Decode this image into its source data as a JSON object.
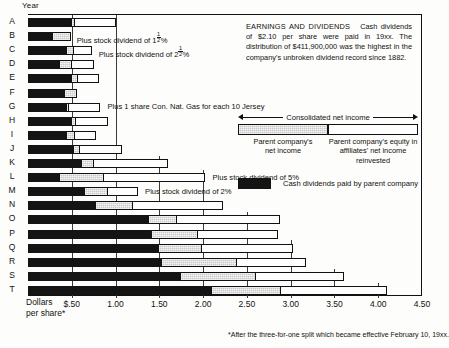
{
  "axis": {
    "y_title": "Year",
    "x_title_line1": "Dollars",
    "x_title_line2": "per share*",
    "ticks": [
      "$.50",
      "1.00",
      "1.50",
      "2.00",
      "2.50",
      "3.00",
      "3.50",
      "4.00",
      "4.50"
    ]
  },
  "headline": {
    "title": "EARNINGS AND DIVIDENDS",
    "body": "Cash dividends of $2.10 per share were paid in 19xx. The distribution of $411,900,000 was the highest in the company's unbroken dividend record since 1882."
  },
  "legend": {
    "consolidated_label": "Consolidated net income",
    "parent_caption_line1": "Parent company's",
    "parent_caption_line2": "net income",
    "affiliates_caption_line1": "Parent company's equity in",
    "affiliates_caption_line2": "affiliates' net income reinvested",
    "cash_label": "Cash dividends paid by parent company"
  },
  "footnote": "*After the three-for-one split which became effective February 10, 19xx.",
  "colors": {
    "cash": "#141414",
    "parent": "#c9c9c9",
    "affiliates": "#fefefe",
    "rule": "#111111"
  },
  "chart_data": {
    "type": "bar",
    "orientation": "horizontal",
    "stacked": true,
    "title": "EARNINGS AND DIVIDENDS",
    "xlabel": "Dollars per share*",
    "ylabel": "Year",
    "xlim": [
      0,
      4.5
    ],
    "xtick_values": [
      0.5,
      1.0,
      1.5,
      2.0,
      2.5,
      3.0,
      3.5,
      4.0,
      4.5
    ],
    "xtick_labels": [
      "$.50",
      "1.00",
      "1.50",
      "2.00",
      "2.50",
      "3.00",
      "3.50",
      "4.00",
      "4.50"
    ],
    "grid": "vertical-partial",
    "legend_position": "upper-right",
    "categories": [
      "A",
      "B",
      "C",
      "D",
      "E",
      "F",
      "G",
      "H",
      "I",
      "J",
      "K",
      "L",
      "M",
      "N",
      "O",
      "P",
      "Q",
      "R",
      "S",
      "T"
    ],
    "series": [
      {
        "name": "Cash dividends paid by parent company",
        "color": "#141414",
        "values": [
          0.5,
          0.28,
          0.44,
          0.37,
          0.5,
          0.42,
          0.45,
          0.5,
          0.45,
          0.52,
          0.62,
          0.36,
          0.65,
          0.78,
          1.38,
          1.42,
          1.5,
          1.53,
          1.75,
          2.1
        ]
      },
      {
        "name": "Parent company's net income",
        "color": "#c9c9c9",
        "values": [
          0.05,
          0.22,
          0.1,
          0.14,
          0.08,
          0.15,
          0.03,
          0.06,
          0.1,
          0.09,
          0.14,
          0.52,
          0.28,
          0.43,
          0.33,
          0.53,
          0.5,
          0.87,
          0.86,
          0.8
        ]
      },
      {
        "name": "Parent company's equity in affiliates' net income reinvested",
        "color": "#fefefe",
        "values": [
          0.48,
          0.0,
          0.21,
          0.27,
          0.25,
          0.0,
          0.37,
          0.38,
          0.25,
          0.49,
          0.86,
          1.17,
          0.35,
          1.04,
          1.19,
          0.93,
          1.05,
          0.8,
          1.02,
          1.22
        ]
      }
    ],
    "totals": [
      1.03,
      0.5,
      0.75,
      0.78,
      0.83,
      0.57,
      0.85,
      0.94,
      0.8,
      1.1,
      1.62,
      2.05,
      1.28,
      2.25,
      2.9,
      2.88,
      3.05,
      3.2,
      3.63,
      4.12
    ]
  },
  "annotations": [
    {
      "row": "B",
      "text_pre": "Plus stock dividend of 1",
      "frac_num": "1",
      "frac_den": "2",
      "text_post": "%"
    },
    {
      "row": "C",
      "text_pre": "Plus stock dividend of 2",
      "frac_num": "1",
      "frac_den": "2",
      "text_post": "%"
    },
    {
      "row": "G",
      "text_pre": "Plus 1 share Con. Nat. Gas for each 10 Jersey",
      "frac_num": "",
      "frac_den": "",
      "text_post": ""
    },
    {
      "row": "L",
      "text_pre": "Plus stock dividend of 5%",
      "frac_num": "",
      "frac_den": "",
      "text_post": ""
    },
    {
      "row": "M",
      "text_pre": "Plus stock dividend of 2%",
      "frac_num": "",
      "frac_den": "",
      "text_post": ""
    }
  ]
}
